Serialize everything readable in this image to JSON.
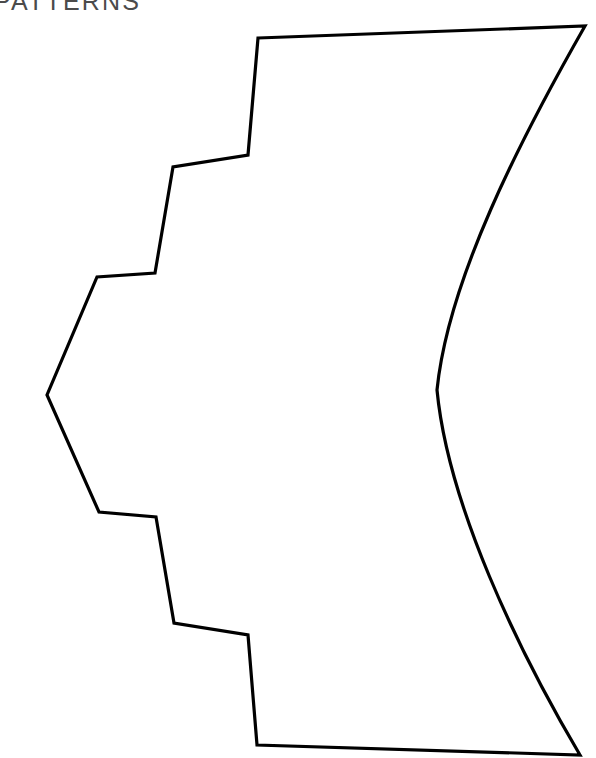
{
  "page": {
    "title": "PATTERNS",
    "background_color": "#ffffff",
    "width": 596,
    "height": 758
  },
  "heading": {
    "text": "PATTERNS",
    "color": "#4b4b4b",
    "note": "cropped at top and left edge of scan"
  },
  "figure": {
    "name": "pattern-piece-outline",
    "stroke_color": "#000000",
    "fill_color": "#ffffff",
    "stroke_width": 3.2,
    "vertices": [
      [
        258,
        38
      ],
      [
        585,
        26
      ],
      [
        437,
        390
      ],
      [
        580,
        755
      ],
      [
        257,
        745
      ],
      [
        248,
        635
      ],
      [
        174,
        623
      ],
      [
        156,
        517
      ],
      [
        99,
        512
      ],
      [
        47,
        395
      ],
      [
        97,
        277
      ],
      [
        155,
        273
      ],
      [
        173,
        167
      ],
      [
        248,
        155
      ]
    ],
    "path": "M 258 38 L 585 26 C 520 140 448 280 437 390 C 448 505 518 650 580 755 L 257 745 L 248 635 L 174 623 L 156 517 L 99 512 L 47 395 L 97 277 L 155 273 L 173 167 L 248 155 Z",
    "segments": [
      {
        "name": "top-edge",
        "type": "line",
        "from": [
          258,
          38
        ],
        "to": [
          585,
          26
        ]
      },
      {
        "name": "right-curve-upper",
        "type": "curve",
        "from": [
          585,
          26
        ],
        "to": [
          437,
          390
        ]
      },
      {
        "name": "right-curve-lower",
        "type": "curve",
        "from": [
          437,
          390
        ],
        "to": [
          580,
          755
        ]
      },
      {
        "name": "bottom-edge",
        "type": "line",
        "from": [
          580,
          755
        ],
        "to": [
          257,
          745
        ]
      },
      {
        "name": "step-1-riser",
        "type": "line",
        "from": [
          257,
          745
        ],
        "to": [
          248,
          635
        ]
      },
      {
        "name": "step-1-tread",
        "type": "line",
        "from": [
          248,
          635
        ],
        "to": [
          174,
          623
        ]
      },
      {
        "name": "step-2-riser",
        "type": "line",
        "from": [
          174,
          623
        ],
        "to": [
          156,
          517
        ]
      },
      {
        "name": "step-2-tread",
        "type": "line",
        "from": [
          156,
          517
        ],
        "to": [
          99,
          512
        ]
      },
      {
        "name": "lower-left-diagonal",
        "type": "line",
        "from": [
          99,
          512
        ],
        "to": [
          47,
          395
        ]
      },
      {
        "name": "upper-left-diagonal",
        "type": "line",
        "from": [
          47,
          395
        ],
        "to": [
          97,
          277
        ]
      },
      {
        "name": "step-3-tread",
        "type": "line",
        "from": [
          97,
          277
        ],
        "to": [
          155,
          273
        ]
      },
      {
        "name": "step-3-riser",
        "type": "line",
        "from": [
          155,
          273
        ],
        "to": [
          173,
          167
        ]
      },
      {
        "name": "step-4-tread",
        "type": "line",
        "from": [
          173,
          167
        ],
        "to": [
          248,
          155
        ]
      },
      {
        "name": "step-4-riser",
        "type": "line",
        "from": [
          248,
          155
        ],
        "to": [
          258,
          38
        ]
      }
    ]
  }
}
